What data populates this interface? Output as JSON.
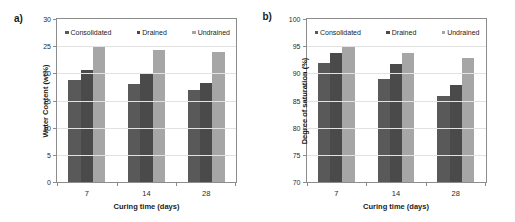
{
  "figure": {
    "panels": [
      {
        "letter": "a)",
        "legend": [
          {
            "label": "Consolidated",
            "color": "#595959"
          },
          {
            "label": "Drained",
            "color": "#4a4a4a"
          },
          {
            "label": "Undrained",
            "color": "#a6a6a6"
          }
        ],
        "chart_data": {
          "type": "bar",
          "title": "",
          "xlabel": "Curing time (days)",
          "ylabel": "Water Content (wt%)",
          "categories": [
            "7",
            "14",
            "28"
          ],
          "ylim": [
            0,
            30
          ],
          "yticks": [
            0,
            5,
            10,
            15,
            20,
            25,
            30
          ],
          "grid": true,
          "legend_position": "top-inside",
          "series": [
            {
              "name": "Consolidated",
              "color": "#595959",
              "values": [
                18.7,
                18.1,
                16.9
              ]
            },
            {
              "name": "Drained",
              "color": "#4a4a4a",
              "values": [
                20.7,
                20.0,
                18.3
              ]
            },
            {
              "name": "Undrained",
              "color": "#a6a6a6",
              "values": [
                24.9,
                24.3,
                24.0
              ]
            }
          ]
        }
      },
      {
        "letter": "b)",
        "legend": [
          {
            "label": "Consolidated",
            "color": "#595959"
          },
          {
            "label": "Drained",
            "color": "#4a4a4a"
          },
          {
            "label": "Undrained",
            "color": "#a6a6a6"
          }
        ],
        "chart_data": {
          "type": "bar",
          "title": "",
          "xlabel": "Curing time (days)",
          "ylabel": "Degree of saturation (%)",
          "categories": [
            "7",
            "14",
            "28"
          ],
          "ylim": [
            70,
            100
          ],
          "yticks": [
            70,
            75,
            80,
            85,
            90,
            95,
            100
          ],
          "grid": true,
          "legend_position": "top-inside",
          "series": [
            {
              "name": "Consolidated",
              "color": "#595959",
              "values": [
                91.9,
                89.0,
                85.8
              ]
            },
            {
              "name": "Drained",
              "color": "#4a4a4a",
              "values": [
                93.8,
                91.8,
                87.9
              ]
            },
            {
              "name": "Undrained",
              "color": "#a6a6a6",
              "values": [
                94.9,
                93.7,
                92.8
              ]
            }
          ]
        }
      }
    ]
  }
}
